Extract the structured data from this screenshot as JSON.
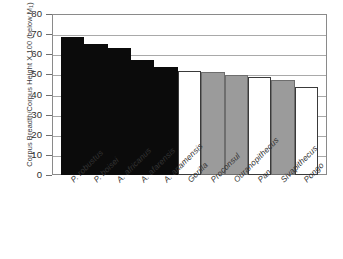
{
  "chart_data": {
    "type": "bar",
    "title": "",
    "subtitle": "",
    "xlabel": "",
    "ylabel": "Corpus Breadth/Corpus Height X 100 (below M1)",
    "ylabel_prefix": "Corpus Breadth/Corpus Height X 100 (below M",
    "ylabel_subscript": "1",
    "ylabel_suffix": ")",
    "ylim": [
      0,
      80
    ],
    "ytick_step": 10,
    "ytick_labels": [
      "0",
      "10",
      "20",
      "30",
      "40",
      "50",
      "60",
      "70",
      "80"
    ],
    "grid": true,
    "legend": "none",
    "categories": [
      "P. robustus",
      "P. boisei",
      "A. africanus",
      "A. afarensis",
      "A. anamensis",
      "Gorilla",
      "Proconsul",
      "Ouranopithecus",
      "Pan",
      "Sivapithecus",
      "Pongo"
    ],
    "values": [
      68.5,
      65.0,
      63.0,
      57.0,
      53.5,
      51.5,
      51.0,
      49.5,
      48.5,
      47.0,
      43.5
    ],
    "bar_fills": [
      "black",
      "black",
      "black",
      "black",
      "black",
      "white",
      "gray",
      "gray",
      "white",
      "gray",
      "white"
    ],
    "colors": {
      "black_bar": "#0b0b0b",
      "gray_bar": "#9b9b9b",
      "white_bar": "#ffffff",
      "bar_outline": "#3a3a3a",
      "gridline": "#a9a9a9",
      "frame": "#8a8a8a",
      "text": "#2e2e2e"
    }
  }
}
